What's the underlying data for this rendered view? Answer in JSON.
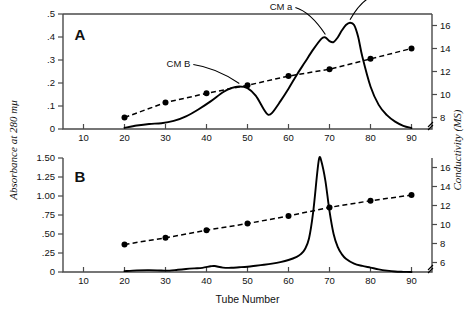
{
  "figure": {
    "x_axis_title": "Tube  Number",
    "left_axis_title": "Absorbance at 280 mμ",
    "right_axis_title": "Conductivity (MS)"
  },
  "panel_a": {
    "letter": "A",
    "left_ticks": [
      "0",
      ".1",
      ".2",
      ".3",
      ".4",
      ".5"
    ],
    "right_ticks": [
      "8",
      "10",
      "12",
      "14",
      "16"
    ],
    "x_ticks": [
      "10",
      "20",
      "30",
      "40",
      "50",
      "60",
      "70",
      "80",
      "90"
    ],
    "annotations": [
      {
        "text": "CM B"
      },
      {
        "text": "CM a"
      },
      {
        "text": "CM a′"
      }
    ]
  },
  "panel_b": {
    "letter": "B",
    "left_ticks": [
      "0",
      ".25",
      ".50",
      ".75",
      "1.00",
      "1.25",
      "1.50"
    ],
    "right_ticks": [
      "6",
      "8",
      "10",
      "12",
      "14",
      "16"
    ],
    "x_ticks": [
      "10",
      "20",
      "30",
      "40",
      "50",
      "60",
      "70",
      "80",
      "90"
    ]
  },
  "chart_data": {
    "type": "line",
    "title": "",
    "xlabel": "Tube Number",
    "ylabel": "Absorbance at 280 mμ",
    "y2label": "Conductivity (MS)",
    "xlim": [
      5,
      95
    ],
    "grid": false,
    "legend": "none",
    "panels": [
      {
        "name": "A",
        "ylim": [
          0,
          0.5
        ],
        "yticks": [
          0,
          0.1,
          0.2,
          0.3,
          0.4,
          0.5
        ],
        "y2lim": [
          7,
          17
        ],
        "y2ticks": [
          8,
          10,
          12,
          14,
          16
        ],
        "xticks": [
          10,
          20,
          30,
          40,
          50,
          60,
          70,
          80,
          90
        ],
        "series": [
          {
            "name": "Absorbance at 280 mμ",
            "style": "solid",
            "axis": "left",
            "x": [
              20,
              23,
              26,
              29,
              32,
              35,
              38,
              41,
              44,
              46,
              48,
              50,
              52,
              54,
              55,
              56,
              58,
              60,
              62,
              64,
              66,
              68,
              69,
              70,
              71,
              72,
              73,
              74,
              75,
              76,
              77,
              78,
              80,
              82,
              84,
              86,
              88,
              90
            ],
            "y": [
              0.005,
              0.015,
              0.022,
              0.025,
              0.035,
              0.055,
              0.085,
              0.12,
              0.16,
              0.178,
              0.185,
              0.178,
              0.145,
              0.085,
              0.062,
              0.07,
              0.12,
              0.175,
              0.235,
              0.29,
              0.345,
              0.392,
              0.398,
              0.382,
              0.378,
              0.398,
              0.428,
              0.452,
              0.462,
              0.452,
              0.4,
              0.315,
              0.185,
              0.105,
              0.06,
              0.032,
              0.014,
              0.004
            ]
          },
          {
            "name": "Conductivity (MS)",
            "style": "dashed",
            "axis": "right",
            "markers": true,
            "x": [
              20,
              30,
              40,
              50,
              60,
              70,
              80,
              90
            ],
            "y": [
              8.0,
              9.3,
              10.1,
              10.8,
              11.6,
              12.2,
              13.1,
              14.0
            ]
          }
        ],
        "annotations": [
          {
            "text": "CM B",
            "x": 48,
            "y": 0.185
          },
          {
            "text": "CM a",
            "x": 69,
            "y": 0.398
          },
          {
            "text": "CM a′",
            "x": 75,
            "y": 0.462
          }
        ]
      },
      {
        "name": "B",
        "ylim": [
          0,
          1.5
        ],
        "yticks": [
          0,
          0.25,
          0.5,
          0.75,
          1.0,
          1.25,
          1.5
        ],
        "y2lim": [
          5,
          17
        ],
        "y2ticks": [
          6,
          8,
          10,
          12,
          14,
          16
        ],
        "xticks": [
          10,
          20,
          30,
          40,
          50,
          60,
          70,
          80,
          90
        ],
        "series": [
          {
            "name": "Absorbance at 280 mμ",
            "style": "solid",
            "axis": "left",
            "x": [
              20,
              23,
              26,
              29,
              31,
              33,
              35,
              37,
              39,
              41,
              42,
              44,
              46,
              48,
              50,
              52,
              54,
              56,
              58,
              60,
              62,
              63,
              64,
              65,
              66,
              67,
              67.5,
              68,
              69,
              70,
              71,
              72,
              73,
              74,
              76,
              78,
              80,
              82,
              84,
              86,
              88,
              90
            ],
            "y": [
              0.012,
              0.022,
              0.025,
              0.02,
              0.018,
              0.03,
              0.04,
              0.048,
              0.055,
              0.075,
              0.078,
              0.058,
              0.055,
              0.062,
              0.07,
              0.082,
              0.095,
              0.11,
              0.13,
              0.158,
              0.2,
              0.235,
              0.3,
              0.44,
              0.78,
              1.3,
              1.5,
              1.46,
              1.2,
              0.8,
              0.5,
              0.33,
              0.235,
              0.175,
              0.11,
              0.08,
              0.058,
              0.035,
              0.018,
              0.006,
              0.002,
              0.0
            ]
          },
          {
            "name": "Conductivity (MS)",
            "style": "dashed",
            "axis": "right",
            "markers": true,
            "x": [
              20,
              30,
              40,
              50,
              60,
              70,
              80,
              90
            ],
            "y": [
              7.9,
              8.6,
              9.4,
              10.1,
              10.9,
              11.8,
              12.5,
              13.1
            ]
          }
        ],
        "annotations": []
      }
    ]
  }
}
